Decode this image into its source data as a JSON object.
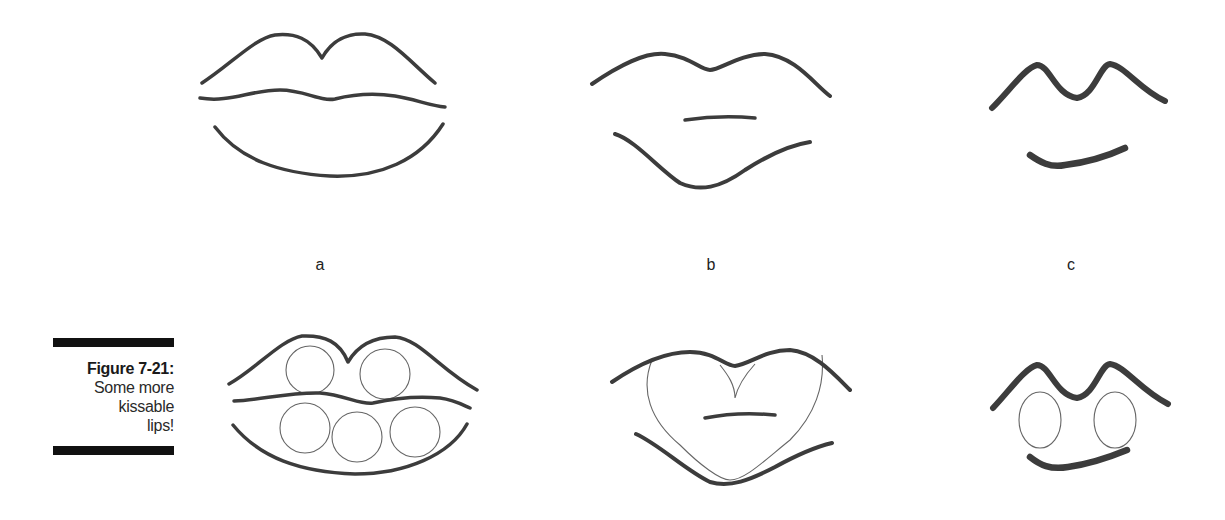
{
  "figure": {
    "number": "Figure 7-21:",
    "caption": "Some more kissable lips!",
    "caption_lines": [
      "Some more",
      "kissable",
      "lips!"
    ]
  },
  "panels": [
    {
      "label": "a",
      "row": 1,
      "description": "full lips outline: upper lip with cupid's bow, middle lip line, lower lip curve"
    },
    {
      "label": "b",
      "row": 1,
      "description": "simplified lips: upper curve, short mouth line, lower V curve"
    },
    {
      "label": "c",
      "row": 1,
      "description": "minimal bold lips: M-shaped upper lip, short curved lower lip"
    },
    {
      "label": "",
      "row": 2,
      "description": "lips 'a' construction with five circles (two upper, three lower)"
    },
    {
      "label": "",
      "row": 2,
      "description": "lips 'b' construction with heart shape"
    },
    {
      "label": "",
      "row": 2,
      "description": "lips 'c' construction with two ovals"
    }
  ],
  "colors": {
    "ink": "#3c3c3c",
    "construction": "#666666",
    "caption_bar": "#111111",
    "background": "#ffffff"
  }
}
